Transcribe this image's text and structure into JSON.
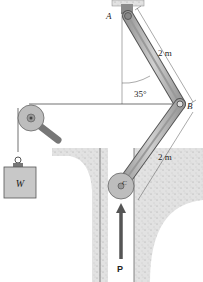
{
  "diagram": {
    "type": "mechanism",
    "points": {
      "A": "A",
      "B": "B",
      "C": "C"
    },
    "dimensions": {
      "AB_length": "2 m",
      "BC_length": "2 m",
      "angle": "35°"
    },
    "load": {
      "weight_label": "W",
      "force_label": "P"
    },
    "caption": "Probs. 11–7/8"
  },
  "colors": {
    "link_fill": "#b8b8b8",
    "link_stroke": "#555555",
    "ground_fill": "#cfcfcf",
    "weight_fill": "#c8c8c8",
    "cord": "#333333",
    "arrow": "#555555"
  }
}
